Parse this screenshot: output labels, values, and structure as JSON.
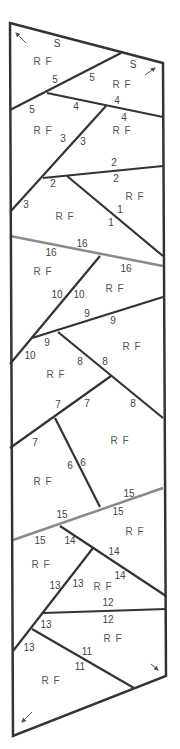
{
  "colors": {
    "line": "#333333",
    "seam": "#8a8a8a",
    "text": "#444444"
  },
  "outline": [
    [
      10,
      23
    ],
    [
      163,
      63
    ],
    [
      166,
      676
    ],
    [
      13,
      736
    ]
  ],
  "lines": [
    {
      "id": "5",
      "pts": [
        [
          10,
          110
        ],
        [
          121,
          53
        ]
      ],
      "gray": false
    },
    {
      "id": "4",
      "pts": [
        [
          47,
          93
        ],
        [
          163,
          117
        ]
      ],
      "gray": false
    },
    {
      "id": "3",
      "pts": [
        [
          10,
          212
        ],
        [
          106,
          106
        ]
      ],
      "gray": false
    },
    {
      "id": "2",
      "pts": [
        [
          43,
          178
        ],
        [
          163,
          166
        ]
      ],
      "gray": false
    },
    {
      "id": "1",
      "pts": [
        [
          67,
          176
        ],
        [
          163,
          256
        ]
      ],
      "gray": false
    },
    {
      "id": "16",
      "pts": [
        [
          10,
          236
        ],
        [
          163,
          266
        ]
      ],
      "gray": true
    },
    {
      "id": "10",
      "pts": [
        [
          10,
          364
        ],
        [
          100,
          256
        ]
      ],
      "gray": true
    },
    {
      "id": "10b",
      "pts": [
        [
          10,
          364
        ],
        [
          100,
          256
        ]
      ],
      "gray": false
    },
    {
      "id": "9",
      "pts": [
        [
          32,
          338
        ],
        [
          163,
          297
        ]
      ],
      "gray": false
    },
    {
      "id": "8",
      "pts": [
        [
          58,
          332
        ],
        [
          163,
          418
        ]
      ],
      "gray": false
    },
    {
      "id": "7",
      "pts": [
        [
          10,
          448
        ],
        [
          111,
          376
        ]
      ],
      "gray": false
    },
    {
      "id": "6",
      "pts": [
        [
          55,
          418
        ],
        [
          100,
          507
        ]
      ],
      "gray": false
    },
    {
      "id": "15",
      "pts": [
        [
          13,
          540
        ],
        [
          163,
          488
        ]
      ],
      "gray": true
    },
    {
      "id": "14",
      "pts": [
        [
          60,
          526
        ],
        [
          166,
          596
        ]
      ],
      "gray": false
    },
    {
      "id": "13",
      "pts": [
        [
          13,
          651
        ],
        [
          93,
          548
        ]
      ],
      "gray": false
    },
    {
      "id": "12",
      "pts": [
        [
          43,
          613
        ],
        [
          166,
          609
        ]
      ],
      "gray": false
    },
    {
      "id": "11",
      "pts": [
        [
          32,
          629
        ],
        [
          134,
          688
        ]
      ],
      "gray": false
    }
  ],
  "labels": [
    {
      "t": "S",
      "x": 57,
      "y": 47
    },
    {
      "t": "S",
      "x": 133,
      "y": 68
    },
    {
      "t": "5",
      "x": 55,
      "y": 83
    },
    {
      "t": "5",
      "x": 92,
      "y": 81
    },
    {
      "t": "5",
      "x": 32,
      "y": 113
    },
    {
      "t": "4",
      "x": 76,
      "y": 110
    },
    {
      "t": "4",
      "x": 117,
      "y": 104
    },
    {
      "t": "4",
      "x": 124,
      "y": 121
    },
    {
      "t": "3",
      "x": 63,
      "y": 142
    },
    {
      "t": "3",
      "x": 83,
      "y": 145
    },
    {
      "t": "2",
      "x": 114,
      "y": 166
    },
    {
      "t": "2",
      "x": 116,
      "y": 182
    },
    {
      "t": "2",
      "x": 53,
      "y": 187
    },
    {
      "t": "1",
      "x": 120,
      "y": 213
    },
    {
      "t": "1",
      "x": 111,
      "y": 226
    },
    {
      "t": "3",
      "x": 26,
      "y": 208
    },
    {
      "t": "16",
      "x": 82,
      "y": 247
    },
    {
      "t": "16",
      "x": 51,
      "y": 256
    },
    {
      "t": "16",
      "x": 126,
      "y": 272
    },
    {
      "t": "10",
      "x": 57,
      "y": 298
    },
    {
      "t": "10",
      "x": 79,
      "y": 298
    },
    {
      "t": "9",
      "x": 87,
      "y": 317
    },
    {
      "t": "9",
      "x": 113,
      "y": 324
    },
    {
      "t": "9",
      "x": 47,
      "y": 346
    },
    {
      "t": "10",
      "x": 30,
      "y": 359
    },
    {
      "t": "8",
      "x": 80,
      "y": 365
    },
    {
      "t": "8",
      "x": 105,
      "y": 365
    },
    {
      "t": "8",
      "x": 133,
      "y": 407
    },
    {
      "t": "7",
      "x": 58,
      "y": 408
    },
    {
      "t": "7",
      "x": 87,
      "y": 407
    },
    {
      "t": "7",
      "x": 35,
      "y": 446
    },
    {
      "t": "6",
      "x": 70,
      "y": 469
    },
    {
      "t": "6",
      "x": 83,
      "y": 466
    },
    {
      "t": "15",
      "x": 129,
      "y": 497
    },
    {
      "t": "15",
      "x": 62,
      "y": 518
    },
    {
      "t": "15",
      "x": 118,
      "y": 515
    },
    {
      "t": "15",
      "x": 40,
      "y": 544
    },
    {
      "t": "14",
      "x": 70,
      "y": 544
    },
    {
      "t": "14",
      "x": 114,
      "y": 555
    },
    {
      "t": "14",
      "x": 120,
      "y": 579
    },
    {
      "t": "13",
      "x": 55,
      "y": 589
    },
    {
      "t": "13",
      "x": 78,
      "y": 587
    },
    {
      "t": "12",
      "x": 108,
      "y": 606
    },
    {
      "t": "12",
      "x": 108,
      "y": 623
    },
    {
      "t": "13",
      "x": 46,
      "y": 628
    },
    {
      "t": "13",
      "x": 29,
      "y": 651
    },
    {
      "t": "11",
      "x": 87,
      "y": 655
    },
    {
      "t": "11",
      "x": 80,
      "y": 670
    }
  ],
  "rf_labels": [
    {
      "x": 43,
      "y": 65
    },
    {
      "x": 122,
      "y": 88
    },
    {
      "x": 43,
      "y": 134
    },
    {
      "x": 122,
      "y": 134
    },
    {
      "x": 135,
      "y": 200
    },
    {
      "x": 65,
      "y": 220
    },
    {
      "x": 43,
      "y": 275
    },
    {
      "x": 115,
      "y": 292
    },
    {
      "x": 132,
      "y": 350
    },
    {
      "x": 56,
      "y": 378
    },
    {
      "x": 120,
      "y": 444
    },
    {
      "x": 43,
      "y": 485
    },
    {
      "x": 135,
      "y": 535
    },
    {
      "x": 41,
      "y": 568
    },
    {
      "x": 103,
      "y": 590
    },
    {
      "x": 113,
      "y": 642
    },
    {
      "x": 51,
      "y": 684
    }
  ],
  "rf_text": "R F",
  "arrows": [
    {
      "dir": "up-left",
      "x1": 26,
      "y1": 43,
      "x2": 16,
      "y2": 33
    },
    {
      "dir": "up-right",
      "x1": 145,
      "y1": 75,
      "x2": 155,
      "y2": 68
    },
    {
      "dir": "down-right",
      "x1": 151,
      "y1": 664,
      "x2": 158,
      "y2": 670
    },
    {
      "dir": "down-left",
      "x1": 32,
      "y1": 712,
      "x2": 22,
      "y2": 722
    }
  ]
}
